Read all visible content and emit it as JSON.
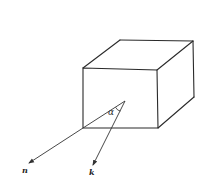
{
  "diagram": {
    "type": "cube-with-vectors",
    "labels": {
      "n": "n",
      "k": "k",
      "alpha": "α"
    },
    "cube": {
      "front_face": {
        "top_left": [
          83,
          68
        ],
        "top_right": [
          157,
          70
        ],
        "bottom_right": [
          158,
          128
        ],
        "bottom_left": [
          83,
          128
        ]
      },
      "back_top_left": [
        120,
        40
      ],
      "back_top_right": [
        193,
        41
      ],
      "back_bottom_right": [
        194,
        97
      ]
    },
    "vectors": {
      "apex": [
        125,
        101
      ],
      "n": {
        "from": [
          125,
          101
        ],
        "via": [
          83,
          128
        ],
        "to": [
          29,
          163
        ]
      },
      "k": {
        "from": [
          125,
          101
        ],
        "to": [
          93,
          165
        ]
      }
    },
    "colors": {
      "line": "#2a2a2a",
      "background": "#ffffff"
    }
  }
}
